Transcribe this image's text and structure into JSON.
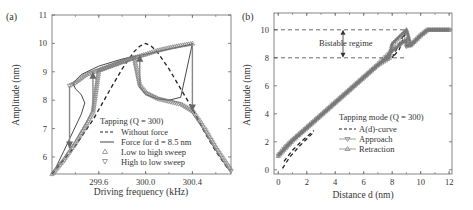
{
  "chart_data": [
    {
      "panel_label": "(a)",
      "type": "line",
      "title": "",
      "xlabel": "Driving frequency (kHz)",
      "ylabel": "Amplitude (nm)",
      "xlim": [
        299.2,
        300.73
      ],
      "ylim": [
        5.4,
        11
      ],
      "xticks": [
        299.6,
        300.0,
        300.4
      ],
      "xtick_labels": [
        "299.6",
        "300.0",
        "300.4"
      ],
      "yticks": [
        6,
        7,
        8,
        9,
        10,
        11
      ],
      "ytick_labels": [
        "6",
        "7",
        "8",
        "9",
        "10",
        "11"
      ],
      "legend": {
        "title": "Tapping (Q = 300)",
        "entries": [
          "Without force",
          "Force for d = 8.5 nm",
          "Low to high sweep",
          "High to low sweep"
        ]
      },
      "series": [
        {
          "name": "Without force",
          "style": "dashed",
          "x": [
            299.2,
            299.4,
            299.55,
            299.7,
            299.8,
            299.9,
            299.95,
            300.0,
            300.05,
            300.1,
            300.2,
            300.3,
            300.4,
            300.5,
            300.6,
            300.7
          ],
          "y": [
            5.4,
            6.4,
            7.3,
            8.4,
            9.1,
            9.7,
            9.9,
            10.0,
            9.9,
            9.7,
            9.1,
            8.4,
            7.7,
            6.9,
            6.2,
            5.6
          ]
        },
        {
          "name": "Force for d = 8.5 nm",
          "style": "solid",
          "x": [
            299.23,
            299.3,
            299.38,
            299.45,
            299.48,
            299.45,
            299.4,
            299.38,
            299.45,
            299.6,
            299.8,
            300.0,
            300.2,
            300.4,
            300.4
          ],
          "y": [
            5.6,
            6.2,
            6.9,
            7.5,
            7.9,
            8.2,
            8.4,
            8.6,
            8.9,
            9.2,
            9.45,
            9.62,
            9.8,
            9.98,
            10.0
          ]
        },
        {
          "name": "Force branch (middle)",
          "style": "solid",
          "x": [
            299.95,
            299.95,
            300.0,
            300.1,
            300.2,
            300.3,
            300.4
          ],
          "y": [
            8.8,
            8.5,
            8.2,
            8.05,
            8.0,
            8.1,
            10.0
          ]
        },
        {
          "name": "Low to high sweep",
          "style": "triangle-up markers",
          "x": [
            299.2,
            299.3,
            299.4,
            299.5,
            299.55,
            299.6,
            299.7,
            299.8,
            299.9,
            300.0,
            300.1,
            300.2,
            300.3,
            300.4
          ],
          "y": [
            5.4,
            5.9,
            6.5,
            7.2,
            7.6,
            9.05,
            9.2,
            9.35,
            9.5,
            9.62,
            9.75,
            9.85,
            9.93,
            10.0
          ]
        },
        {
          "name": "High to low sweep",
          "style": "triangle-down markers",
          "x": [
            300.73,
            300.6,
            300.5,
            300.4,
            300.3,
            300.2,
            300.1,
            300.0,
            299.95,
            299.9,
            299.8,
            299.7,
            299.6,
            299.5,
            299.4,
            299.35
          ],
          "y": [
            5.5,
            6.3,
            7.0,
            7.6,
            7.85,
            7.95,
            8.05,
            8.25,
            8.5,
            9.5,
            9.35,
            9.2,
            9.05,
            8.9,
            8.6,
            8.5
          ]
        }
      ],
      "arrows": [
        {
          "x": 299.35,
          "from": 8.5,
          "to": 6.3,
          "direction": "down"
        },
        {
          "x": 299.55,
          "from": 7.6,
          "to": 9.0,
          "direction": "up"
        },
        {
          "x": 299.95,
          "from": 8.5,
          "to": 9.6,
          "direction": "up"
        },
        {
          "x": 300.4,
          "from": 10.0,
          "to": 7.6,
          "direction": "down"
        }
      ]
    },
    {
      "panel_label": "(b)",
      "type": "line",
      "title": "",
      "xlabel": "Distance d (nm)",
      "ylabel": "Amplitude (nm)",
      "xlim": [
        -0.3,
        12.2
      ],
      "ylim": [
        -0.3,
        11.2
      ],
      "xticks": [
        0,
        2,
        4,
        6,
        8,
        10,
        12
      ],
      "xtick_labels": [
        "0",
        "2",
        "4",
        "6",
        "8",
        "10",
        "12"
      ],
      "yticks": [
        0,
        2,
        4,
        6,
        8,
        10
      ],
      "ytick_labels": [
        "0",
        "2",
        "4",
        "6",
        "8",
        "10"
      ],
      "annotation": "Bistable regime",
      "bistable_lines": [
        8,
        10
      ],
      "legend": {
        "title": "Tapping mode (Q = 300)",
        "entries": [
          "A(d)-curve",
          "Approach",
          "Retraction"
        ]
      },
      "series": [
        {
          "name": "A(d)-curve (lower branch)",
          "style": "dashed",
          "x": [
            0.3,
            0.8,
            1.5,
            2.5
          ],
          "y": [
            0.1,
            0.9,
            1.7,
            2.7
          ]
        },
        {
          "name": "A(d)-curve (upper branch)",
          "style": "dashed",
          "x": [
            0.4,
            1.0,
            1.7,
            2.5
          ],
          "y": [
            0.6,
            1.4,
            2.1,
            2.8
          ]
        },
        {
          "name": "A(d)-curve (bistable)",
          "style": "dashed",
          "x": [
            8.0,
            8.5,
            9.0,
            8.5,
            8.0
          ],
          "y": [
            8.0,
            9.0,
            10.0,
            8.6,
            8.0
          ]
        },
        {
          "name": "Approach",
          "style": "line with triangle-down markers",
          "x": [
            0,
            0.5,
            1,
            2,
            3,
            4,
            5,
            6,
            7,
            8,
            9,
            9.0,
            9.3,
            10,
            10.5,
            11,
            12
          ],
          "y": [
            1.0,
            1.6,
            2.1,
            3.0,
            3.9,
            4.8,
            5.7,
            6.6,
            7.5,
            8.5,
            9.3,
            8.8,
            8.9,
            9.6,
            10.0,
            10.0,
            10.0
          ]
        },
        {
          "name": "Retraction",
          "style": "line with triangle-up markers",
          "x": [
            12,
            11,
            10.5,
            10,
            9.3,
            9.0,
            8.0,
            7.8,
            7,
            6,
            5,
            4,
            3,
            2,
            1,
            0
          ],
          "y": [
            10.0,
            10.0,
            10.0,
            9.6,
            8.9,
            10.0,
            9.0,
            8.0,
            7.5,
            6.6,
            5.7,
            4.8,
            3.9,
            3.0,
            2.1,
            1.0
          ]
        }
      ]
    }
  ],
  "colors": {
    "axis": "#555555",
    "text": "#333333",
    "marker_line": "#777777",
    "dashed": "#222222",
    "solid": "#333333"
  }
}
